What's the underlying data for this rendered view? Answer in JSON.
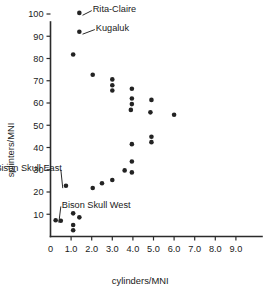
{
  "chart_data": {
    "type": "scatter",
    "title": "",
    "xlabel": "cylinders/MNI",
    "ylabel": "splinters/MNI",
    "xlim": [
      0,
      9.8
    ],
    "ylim": [
      0,
      104
    ],
    "grid": false,
    "legend": null,
    "xticks": [
      "0",
      "1.0",
      "2.0",
      "3.0",
      "4.0",
      "5.0",
      "6.0",
      "7.0",
      "8.0",
      "9.0"
    ],
    "xtickvalues": [
      0,
      1,
      2,
      3,
      4,
      5,
      6,
      7,
      8,
      9
    ],
    "yticks": [
      "10",
      "20",
      "30",
      "40",
      "50",
      "60",
      "70",
      "80",
      "90",
      "100"
    ],
    "ytickvalues": [
      10,
      20,
      30,
      40,
      50,
      60,
      70,
      80,
      90,
      100
    ],
    "points": [
      {
        "x": 1.4,
        "y": 100.5,
        "label": "Rita-Claire"
      },
      {
        "x": 1.4,
        "y": 92.0,
        "label": "Kugaluk"
      },
      {
        "x": 1.1,
        "y": 81.8,
        "label": ""
      },
      {
        "x": 2.05,
        "y": 72.7,
        "label": ""
      },
      {
        "x": 3.0,
        "y": 70.6,
        "label": ""
      },
      {
        "x": 3.0,
        "y": 68.0,
        "label": ""
      },
      {
        "x": 3.0,
        "y": 65.6,
        "label": ""
      },
      {
        "x": 3.95,
        "y": 66.4,
        "label": ""
      },
      {
        "x": 3.95,
        "y": 62.0,
        "label": ""
      },
      {
        "x": 3.95,
        "y": 59.5,
        "label": ""
      },
      {
        "x": 3.9,
        "y": 56.9,
        "label": ""
      },
      {
        "x": 4.9,
        "y": 61.4,
        "label": ""
      },
      {
        "x": 4.85,
        "y": 55.8,
        "label": ""
      },
      {
        "x": 6.0,
        "y": 54.7,
        "label": ""
      },
      {
        "x": 4.9,
        "y": 44.8,
        "label": ""
      },
      {
        "x": 4.9,
        "y": 42.4,
        "label": ""
      },
      {
        "x": 3.95,
        "y": 41.5,
        "label": ""
      },
      {
        "x": 3.95,
        "y": 33.7,
        "label": ""
      },
      {
        "x": 3.6,
        "y": 29.7,
        "label": ""
      },
      {
        "x": 3.95,
        "y": 28.8,
        "label": ""
      },
      {
        "x": 3.0,
        "y": 25.4,
        "label": ""
      },
      {
        "x": 2.5,
        "y": 23.9,
        "label": ""
      },
      {
        "x": 2.05,
        "y": 21.8,
        "label": ""
      },
      {
        "x": 0.75,
        "y": 22.8,
        "label": "Bison Skull East"
      },
      {
        "x": 1.1,
        "y": 10.4,
        "label": ""
      },
      {
        "x": 1.4,
        "y": 8.6,
        "label": ""
      },
      {
        "x": 0.25,
        "y": 7.3,
        "label": "Bison Skull West"
      },
      {
        "x": 0.5,
        "y": 7.1,
        "label": ""
      },
      {
        "x": 1.1,
        "y": 5.2,
        "label": ""
      },
      {
        "x": 1.1,
        "y": 2.8,
        "label": ""
      }
    ],
    "annotations": [
      {
        "text": "Rita-Claire",
        "point_x": 1.4,
        "point_y": 100.5,
        "text_x": 2.05,
        "text_y": 102.5
      },
      {
        "text": "Kugaluk",
        "point_x": 1.4,
        "point_y": 92.0,
        "text_x": 2.2,
        "text_y": 94.0
      },
      {
        "text": "Bison Skull East",
        "point_x": 0.75,
        "point_y": 22.8,
        "text_x": 0.55,
        "text_y": 31.0
      },
      {
        "text": "Bison Skull West",
        "point_x": 0.25,
        "point_y": 7.3,
        "text_x": 0.55,
        "text_y": 14.5
      }
    ]
  }
}
